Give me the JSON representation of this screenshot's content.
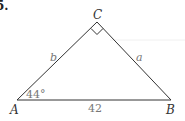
{
  "problem_number": "5.",
  "triangle": {
    "vertices": {
      "A": {
        "label": "A",
        "x": 17,
        "y": 100
      },
      "B": {
        "label": "B",
        "x": 171,
        "y": 100
      },
      "C": {
        "label": "C",
        "x": 97,
        "y": 22
      }
    },
    "right_angle_at": "C",
    "angle_A": "44°",
    "sides": {
      "b": "b",
      "a": "a",
      "c": "42"
    }
  },
  "colors": {
    "line": "#333333",
    "label": "#333333",
    "measure": "#777777"
  }
}
